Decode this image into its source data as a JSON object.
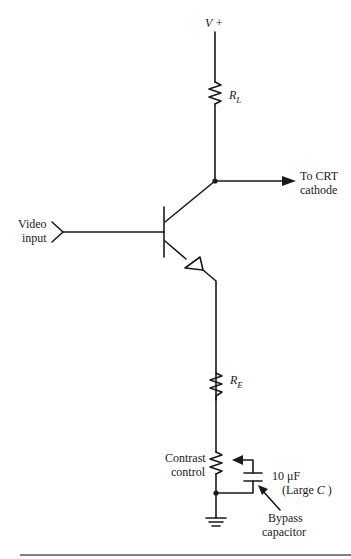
{
  "diagram": {
    "type": "circuit-schematic",
    "labels": {
      "supply": "V +",
      "load_resistor_main": "R",
      "load_resistor_sub": "L",
      "output_line1": "To CRT",
      "output_line2": "cathode",
      "input_line1": "Video",
      "input_line2": "input",
      "emitter_resistor_main": "R",
      "emitter_resistor_sub": "E",
      "contrast_line1": "Contrast",
      "contrast_line2": "control",
      "cap_value": "10  μF",
      "cap_note_prefix": "(Large ",
      "cap_note_var": "C",
      "cap_note_suffix": " )",
      "bypass_line1": "Bypass",
      "bypass_line2": "capacitor"
    },
    "components": [
      {
        "id": "Vplus",
        "kind": "supply"
      },
      {
        "id": "RL",
        "kind": "resistor",
        "role": "collector load"
      },
      {
        "id": "Q1",
        "kind": "NPN transistor"
      },
      {
        "id": "RE",
        "kind": "resistor",
        "role": "emitter resistor"
      },
      {
        "id": "contrast",
        "kind": "potentiometer",
        "role": "contrast control"
      },
      {
        "id": "C1",
        "kind": "capacitor",
        "value": "10 μF",
        "role": "bypass capacitor"
      },
      {
        "id": "GND",
        "kind": "ground"
      }
    ],
    "colors": {
      "ink": "#1a1a1a",
      "background": "#ffffff",
      "rule": "#555555"
    }
  }
}
